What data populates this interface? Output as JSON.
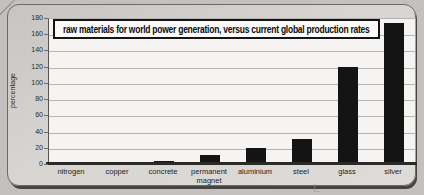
{
  "chart_data": {
    "type": "bar",
    "title": "raw materials for world power generation, versus current global production rates",
    "xlabel": "",
    "ylabel": "percentage",
    "categories": [
      "nitrogen",
      "copper",
      "concrete",
      "permanent magnet",
      "aluminium",
      "steel",
      "glass",
      "silver"
    ],
    "values": [
      0.5,
      2,
      3.5,
      11,
      20,
      31,
      120,
      174
    ],
    "yticks": [
      0,
      20,
      40,
      60,
      80,
      100,
      120,
      140,
      160,
      180
    ],
    "ylim": [
      0,
      180
    ],
    "grid": true,
    "legend": null,
    "bar_color": "#141414",
    "plot_background": "#f5f4f2",
    "card_background": "#d6d5d2"
  }
}
